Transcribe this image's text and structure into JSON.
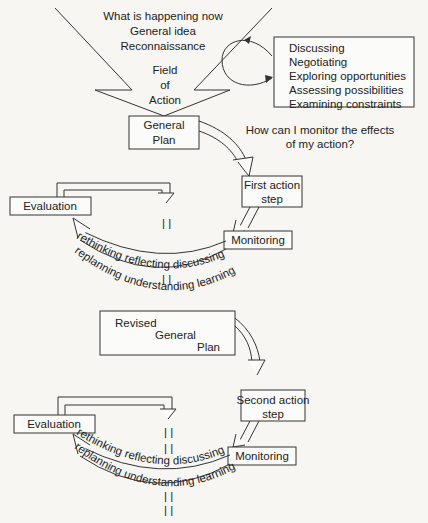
{
  "diagram": {
    "title_lines": [
      "What is happening now",
      "General idea",
      "Reconnaissance"
    ],
    "field_lines": [
      "Field",
      "of",
      "Action"
    ],
    "side_box_items": [
      "Discussing",
      "Negotiating",
      "Exploring opportunities",
      "Assessing possibilities",
      "Examining constraints"
    ],
    "general_plan": [
      "General",
      "Plan"
    ],
    "monitor_question": [
      "How can I monitor the effects",
      "of my action?"
    ],
    "cycle1": {
      "action_step": [
        "First action",
        "step"
      ],
      "evaluation": "Evaluation",
      "monitoring": "Monitoring",
      "inner_arc_text": "rethinking reflecting discussing",
      "outer_arc_text": "replanning   understanding   learning"
    },
    "revised_plan": [
      "Revised",
      "General",
      "Plan"
    ],
    "cycle2": {
      "action_step": [
        "Second  action",
        "step"
      ],
      "evaluation": "Evaluation",
      "monitoring": "Monitoring",
      "inner_arc_text": "rethinking reflecting discussing",
      "outer_arc_text": "replanning   understanding   learning"
    }
  }
}
